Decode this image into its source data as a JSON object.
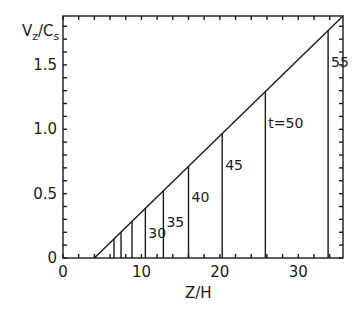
{
  "chart_data": {
    "type": "line",
    "title": "",
    "xlabel": "Z/H",
    "ylabel": "V_z/C_s",
    "xlim": [
      0,
      35.7
    ],
    "ylim": [
      0,
      1.88
    ],
    "xticks": [
      0,
      10,
      20,
      30
    ],
    "yticks": [
      0,
      0.5,
      1.0,
      1.5
    ],
    "yticks_labels": [
      "0",
      "0.5",
      "1.0",
      "1.5"
    ],
    "xticks_labels": [
      "0",
      "10",
      "20",
      "30"
    ],
    "grid": false,
    "legend": null,
    "series": [
      {
        "name": "velocity front",
        "x": [
          4.0,
          35.7
        ],
        "y": [
          0,
          1.88
        ]
      }
    ],
    "time_markers": [
      {
        "label": "",
        "z": 6.5
      },
      {
        "label": "",
        "z": 7.4
      },
      {
        "label": "",
        "z": 8.8
      },
      {
        "label": "30",
        "z": 10.5
      },
      {
        "label": "35",
        "z": 12.8
      },
      {
        "label": "40",
        "z": 16.0
      },
      {
        "label": "45",
        "z": 20.3
      },
      {
        "label": "t=50",
        "z": 25.8
      },
      {
        "label": "55",
        "z": 33.8
      }
    ],
    "annotations": [
      "30",
      "35",
      "40",
      "45",
      "t=50",
      "55"
    ]
  },
  "labels": {
    "ylabel_main": "V",
    "ylabel_sub1": "z",
    "ylabel_mid": "/C",
    "ylabel_sub2": "s",
    "xlabel": "Z/H"
  }
}
